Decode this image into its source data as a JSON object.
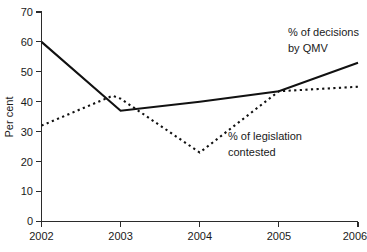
{
  "chart_data": {
    "type": "line",
    "title": "",
    "subtitle": "",
    "xlabel": "",
    "ylabel": "Per cent",
    "x": [
      2002,
      2003,
      2004,
      2005,
      2006
    ],
    "xtick_labels": [
      "2002",
      "2003",
      "2004",
      "2005",
      "2006"
    ],
    "ytick_labels": [
      "0",
      "10",
      "20",
      "30",
      "40",
      "50",
      "60",
      "70"
    ],
    "ytick_values": [
      0,
      10,
      20,
      30,
      40,
      50,
      60,
      70
    ],
    "xlim": [
      2002,
      2006
    ],
    "ylim": [
      0,
      70
    ],
    "grid": false,
    "legend_position": "inline-annotations",
    "series": [
      {
        "name": "% of decisions by QMV",
        "style": "solid",
        "color": "#111111",
        "x": [
          2002,
          2003,
          2004,
          2005,
          2006
        ],
        "values": [
          60,
          37,
          40,
          43.5,
          53
        ]
      },
      {
        "name": "% of legislation contested",
        "style": "dotted",
        "color": "#111111",
        "x": [
          2002,
          2002.9,
          2003,
          2004,
          2005,
          2006
        ],
        "values": [
          32,
          42,
          41,
          23,
          43.5,
          45
        ]
      }
    ],
    "annotations": [
      {
        "id": "annotation-qmv",
        "lines": [
          "% of decisions",
          "by QMV"
        ],
        "refers_to": "% of decisions by QMV"
      },
      {
        "id": "annotation-contested",
        "lines": [
          "% of legislation",
          "contested"
        ],
        "refers_to": "% of legislation contested"
      }
    ]
  },
  "axes": {
    "y_title": "Per cent",
    "y_ticks": [
      {
        "label": "70"
      },
      {
        "label": "60"
      },
      {
        "label": "50"
      },
      {
        "label": "40"
      },
      {
        "label": "30"
      },
      {
        "label": "20"
      },
      {
        "label": "10"
      },
      {
        "label": "0"
      }
    ],
    "x_ticks": [
      {
        "label": "2002"
      },
      {
        "label": "2003"
      },
      {
        "label": "2004"
      },
      {
        "label": "2005"
      },
      {
        "label": "2006"
      }
    ]
  },
  "annotations": {
    "qmv": {
      "line1": "% of decisions",
      "line2": "by QMV"
    },
    "contested": {
      "line1": "% of legislation",
      "line2": "contested"
    }
  },
  "colors": {
    "background": "#ffffff",
    "axis": "#2b2b2b",
    "series": "#111111",
    "text": "#1a1a1a"
  }
}
